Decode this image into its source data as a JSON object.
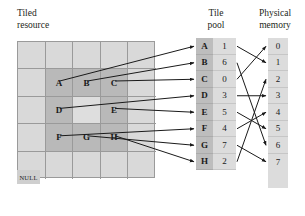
{
  "headings": {
    "tiled_resource": "Tiled\nresource",
    "tile_pool": "Tile\npool",
    "physical_memory": "Physical\nmemory"
  },
  "colors": {
    "background": "#ffffff",
    "grid_light": "#d9d9d9",
    "grid_dark": "#b9b9b9",
    "grid_hole": "#dedede",
    "grid_line": "#9a9a9a",
    "pool_key": "#bdbdbd",
    "pool_value": "#dcdcdc",
    "physical": "#dcdcdc",
    "arrow": "#1a1a1a",
    "text": "#231f20"
  },
  "tiled_resource": {
    "columns": 5,
    "rows": 5,
    "mapped_region": {
      "col_start": 2,
      "col_end": 4,
      "row_start": 2,
      "row_end": 4
    },
    "cells": [
      {
        "row": 1,
        "col": 1,
        "label": "",
        "state": "unmapped"
      },
      {
        "row": 1,
        "col": 2,
        "label": "",
        "state": "unmapped"
      },
      {
        "row": 1,
        "col": 3,
        "label": "",
        "state": "unmapped"
      },
      {
        "row": 1,
        "col": 4,
        "label": "",
        "state": "unmapped"
      },
      {
        "row": 1,
        "col": 5,
        "label": "",
        "state": "unmapped"
      },
      {
        "row": 2,
        "col": 1,
        "label": "",
        "state": "unmapped"
      },
      {
        "row": 2,
        "col": 2,
        "label": "A",
        "state": "mapped"
      },
      {
        "row": 2,
        "col": 3,
        "label": "B",
        "state": "mapped"
      },
      {
        "row": 2,
        "col": 4,
        "label": "C",
        "state": "mapped"
      },
      {
        "row": 2,
        "col": 5,
        "label": "",
        "state": "unmapped"
      },
      {
        "row": 3,
        "col": 1,
        "label": "",
        "state": "unmapped"
      },
      {
        "row": 3,
        "col": 2,
        "label": "D",
        "state": "mapped"
      },
      {
        "row": 3,
        "col": 3,
        "label": "",
        "state": "hole"
      },
      {
        "row": 3,
        "col": 4,
        "label": "E",
        "state": "mapped"
      },
      {
        "row": 3,
        "col": 5,
        "label": "",
        "state": "unmapped"
      },
      {
        "row": 4,
        "col": 1,
        "label": "",
        "state": "unmapped"
      },
      {
        "row": 4,
        "col": 2,
        "label": "F",
        "state": "mapped"
      },
      {
        "row": 4,
        "col": 3,
        "label": "G",
        "state": "mapped"
      },
      {
        "row": 4,
        "col": 4,
        "label": "H",
        "state": "mapped"
      },
      {
        "row": 4,
        "col": 5,
        "label": "",
        "state": "unmapped"
      },
      {
        "row": 5,
        "col": 1,
        "label": "",
        "state": "unmapped"
      },
      {
        "row": 5,
        "col": 2,
        "label": "",
        "state": "unmapped"
      },
      {
        "row": 5,
        "col": 3,
        "label": "",
        "state": "unmapped"
      },
      {
        "row": 5,
        "col": 4,
        "label": "",
        "state": "unmapped"
      },
      {
        "row": 5,
        "col": 5,
        "label": "",
        "state": "unmapped"
      }
    ]
  },
  "tile_pool": {
    "entries": [
      {
        "key": "A",
        "value": "1"
      },
      {
        "key": "B",
        "value": "6"
      },
      {
        "key": "C",
        "value": "0"
      },
      {
        "key": "D",
        "value": "3"
      },
      {
        "key": "E",
        "value": "5"
      },
      {
        "key": "F",
        "value": "4"
      },
      {
        "key": "G",
        "value": "7"
      },
      {
        "key": "H",
        "value": "2"
      }
    ],
    "null_label": "NULL"
  },
  "physical_memory": {
    "slots": [
      "0",
      "1",
      "2",
      "3",
      "4",
      "5",
      "6",
      "7"
    ]
  },
  "mappings": {
    "tile_to_slot": [
      {
        "tile": "A",
        "slot": "1"
      },
      {
        "tile": "B",
        "slot": "6"
      },
      {
        "tile": "C",
        "slot": "0"
      },
      {
        "tile": "D",
        "slot": "3"
      },
      {
        "tile": "E",
        "slot": "5"
      },
      {
        "tile": "F",
        "slot": "4"
      },
      {
        "tile": "G",
        "slot": "7"
      },
      {
        "tile": "H",
        "slot": "2"
      }
    ]
  }
}
